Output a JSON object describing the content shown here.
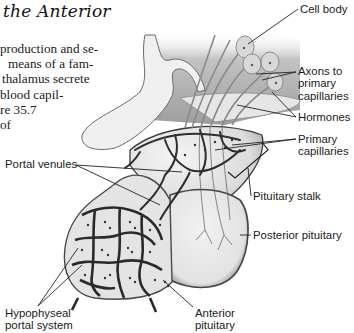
{
  "page": {
    "heading": "the Anterior",
    "body_lines": [
      "production and se-",
      "means of a fam-",
      "thalamus secrete",
      "blood capil-",
      "re 35.7",
      "of"
    ]
  },
  "figure": {
    "labels": {
      "cell_body": [
        "Cell body"
      ],
      "axons": [
        "Axons to",
        "primary",
        "capillaries"
      ],
      "hormones": [
        "Hormones"
      ],
      "primary_capillaries": [
        "Primary",
        "capillaries"
      ],
      "pituitary_stalk": [
        "Pituitary stalk"
      ],
      "posterior_pituitary": [
        "Posterior pituitary"
      ],
      "portal_venules": [
        "Portal venules"
      ],
      "hypophyseal_portal_system": [
        "Hypophyseal",
        "portal system"
      ],
      "anterior_pituitary": [
        "Anterior",
        "pituitary"
      ]
    },
    "colors": {
      "tissue_light": "#ececec",
      "tissue_mid": "#c8c8c8",
      "tissue_dark": "#5a5a5a",
      "outline": "#3a3a3a",
      "leader_line": "#222222"
    }
  }
}
